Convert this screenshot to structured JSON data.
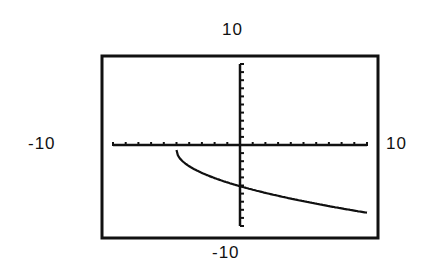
{
  "chart_data": {
    "type": "line",
    "title": "",
    "xlabel": "",
    "ylabel": "",
    "xlim": [
      -10,
      10
    ],
    "ylim": [
      -10,
      10
    ],
    "window_labels": {
      "ymax": "10",
      "ymin": "-10",
      "xmin": "-10",
      "xmax": "10"
    },
    "grid": false,
    "ticks": "unit tick marks on both axes",
    "series": [
      {
        "name": "curve",
        "function": "y = -2*sqrt(x+5)",
        "x": [
          -5,
          -4,
          -3,
          -2,
          -1,
          0,
          1,
          2,
          3,
          4,
          5,
          6,
          7,
          8,
          9,
          10
        ],
        "y": [
          0,
          -2,
          -2.83,
          -3.46,
          -4,
          -4.47,
          -4.9,
          -5.29,
          -5.66,
          -6,
          -6.32,
          -6.63,
          -6.93,
          -7.21,
          -7.48,
          -7.75
        ]
      }
    ]
  }
}
